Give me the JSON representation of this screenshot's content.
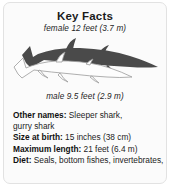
{
  "card": {
    "title": "Key Facts",
    "illustration": {
      "female_label": "female 12 feet (3.7 m)",
      "male_label": "male 9.5 feet (2.9 m)",
      "female_color": "#4a4a4a",
      "male_color": "#fdfdfd",
      "male_outline_color": "#9a9a9a"
    },
    "facts": [
      {
        "label": "Other names:",
        "value": "Sleeper shark,",
        "continuation": "gurry shark"
      },
      {
        "label": "Size at birth:",
        "value": "15 inches (38 cm)"
      },
      {
        "label": "Maximum length:",
        "value": "21 feet (6.4 m)"
      },
      {
        "label": "Diet:",
        "value": "Seals, bottom fishes, invertebrates,"
      }
    ]
  }
}
